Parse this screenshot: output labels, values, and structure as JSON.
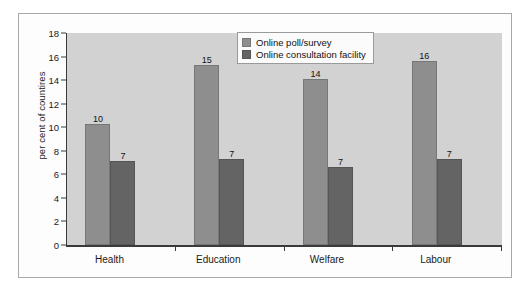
{
  "chart_data": {
    "type": "bar",
    "title": "",
    "subtitle": "",
    "xlabel": "",
    "ylabel": "per cent of countires",
    "categories": [
      "Health",
      "Education",
      "Welfare",
      "Labour"
    ],
    "series": [
      {
        "name": "Online poll/survey",
        "color": "#8e8e8e",
        "values": [
          10.3,
          15.3,
          14.1,
          15.6
        ],
        "data_labels": [
          "10",
          "15",
          "14",
          "16"
        ]
      },
      {
        "name": "Online consultation facility",
        "color": "#646464",
        "values": [
          7.1,
          7.3,
          6.6,
          7.3
        ],
        "data_labels": [
          "7",
          "7",
          "7",
          "7"
        ]
      }
    ],
    "ylim": [
      0,
      18
    ],
    "ytick_values": [
      0,
      2,
      4,
      6,
      8,
      10,
      12,
      14,
      16,
      18
    ],
    "ytick_labels": [
      "0",
      "2",
      "4",
      "6",
      "8",
      "10",
      "12",
      "14",
      "16",
      "18"
    ],
    "grid": false,
    "legend_position": "top-center",
    "plot_background": "#d2d2d2",
    "figure_background": "#fdfdfd",
    "axis_color": "#3a3a3a"
  }
}
